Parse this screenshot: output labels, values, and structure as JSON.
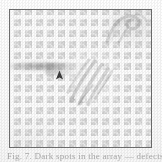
{
  "figure": {
    "kind": "scanned-figure-panel",
    "width_px": 162,
    "height_px": 162,
    "background_color": "#fdfdfd",
    "frame": {
      "border_color": "#6f6f6f",
      "fill_color": "#fafafa",
      "left_px": 9,
      "top_px": 9,
      "width_px": 143,
      "height_px": 139
    },
    "array": {
      "pattern": "rounded-square-lattice",
      "columns": 13,
      "rows": 13,
      "pitch_px": 11,
      "cell_color": "#cecece",
      "gutter_color": "#fcfcfc"
    },
    "artifacts": [
      {
        "name": "curved-loop-filament",
        "position": "top-right",
        "tone": "#707070",
        "shape": "looping curved filament"
      },
      {
        "name": "horizontal-smear",
        "position": "middle-left",
        "tone": "#787878",
        "shape": "elongated horizontal streak"
      },
      {
        "name": "diagonal-fiber-cluster",
        "position": "center",
        "tone": "#8c8c8c",
        "shape": "bright diagonal fibrous bundle"
      }
    ],
    "marker": {
      "name": "arrowhead-pointer",
      "glyph": "arrowhead",
      "color": "#3a3a3a",
      "points": "up",
      "x_px": 45,
      "y_px": 60
    }
  },
  "caption": {
    "visible_fragment": "the tops of a cropped caption line",
    "text": "Fig. 7. Dark spots in the array — defects",
    "color": "#8a8a8a",
    "cropped": true
  }
}
